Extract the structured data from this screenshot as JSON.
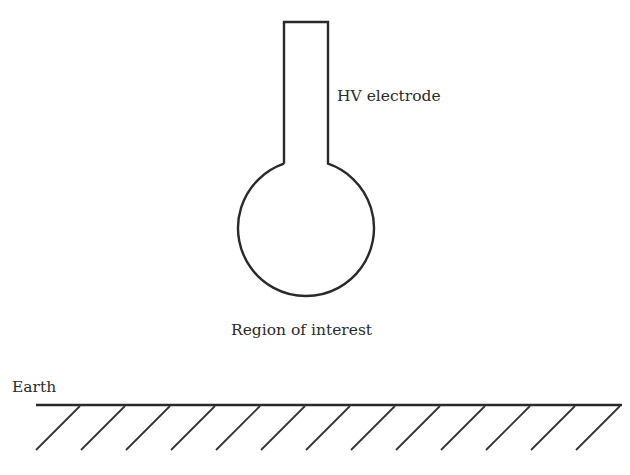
{
  "diagram": {
    "labels": {
      "electrode": "HV electrode",
      "region": "Region of interest",
      "earth": "Earth"
    },
    "electrode": {
      "stem": {
        "left_x": 284,
        "right_x": 328,
        "top_y": 22,
        "join_y": 164
      },
      "sphere": {
        "cx": 306,
        "cy": 228,
        "r": 68
      }
    },
    "ground": {
      "line": {
        "x1": 36,
        "x2": 622,
        "y": 405
      },
      "hatch_count": 13,
      "hatch_spacing": 45,
      "hatch_dx": -44,
      "hatch_dy": 45
    },
    "colors": {
      "stroke": "#2a2a2a",
      "text": "#2b2b2b",
      "background": "#ffffff"
    }
  }
}
